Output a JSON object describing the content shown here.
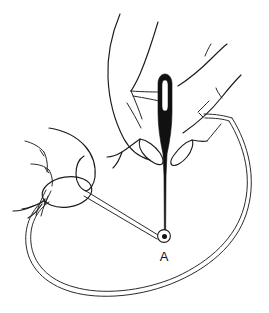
{
  "figure": {
    "background_color": "#ffffff",
    "ink_color": "#1a1a1a",
    "needle_color": "#111111",
    "cord_color": "#2b2b2b",
    "style": "black-and-white line drawing"
  },
  "labels": [
    {
      "id": "point-a",
      "text": "A",
      "x": 164,
      "y": 260,
      "describes": "eyelet / opening where the bodkin enters the casing"
    }
  ],
  "objects": {
    "needle": {
      "name": "bodkin-needle",
      "orientation": "vertical",
      "tip_at": "bottom",
      "eye_at": "top",
      "eye_visible": true,
      "top_y": 74,
      "tip_y": 236,
      "center_x": 165
    },
    "eyelet": {
      "name": "eyelet-at-point-a",
      "cx": 164,
      "cy": 236,
      "outer_radius": 6.5,
      "inner_radius": 2.6
    },
    "cord": {
      "name": "elastic-cord-loop",
      "shape": "open oval loop",
      "rendered_as": "double line",
      "attached_to": "eyelet at point A"
    },
    "hands": [
      {
        "name": "right-hand-holding-needle",
        "position": "upper-center",
        "action": "pinching the bodkin between thumb and index finger"
      },
      {
        "name": "left-hand-holding-cord",
        "position": "mid-left",
        "action": "pinching the cord end between thumb and fingers"
      }
    ]
  }
}
